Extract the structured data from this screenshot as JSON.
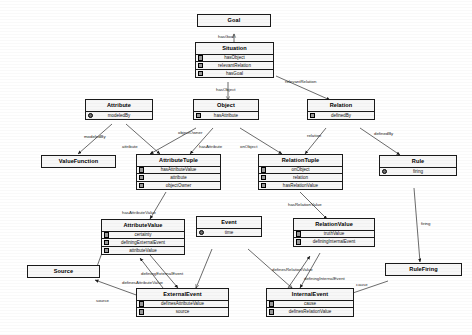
{
  "diagram": {
    "kind": "uml-class-diagram",
    "classes": [
      {
        "id": "goal",
        "name": "Goal",
        "attributes": []
      },
      {
        "id": "situation",
        "name": "Situation",
        "attributes": [
          "hasObject",
          "relevantRelation",
          "hasGoal"
        ]
      },
      {
        "id": "attribute",
        "name": "Attribute",
        "attributes": [
          "modeledBy"
        ]
      },
      {
        "id": "object",
        "name": "Object",
        "attributes": [
          "hasAttribute"
        ]
      },
      {
        "id": "relation",
        "name": "Relation",
        "attributes": [
          "definedBy"
        ]
      },
      {
        "id": "valuefunction",
        "name": "ValueFunction",
        "attributes": []
      },
      {
        "id": "attributetuple",
        "name": "AttributeTuple",
        "attributes": [
          "hasAttributeValue",
          "attribute",
          "objectOwner"
        ]
      },
      {
        "id": "relationtuple",
        "name": "RelationTuple",
        "attributes": [
          "onObject",
          "relation",
          "hasRelationValue"
        ]
      },
      {
        "id": "rule",
        "name": "Rule",
        "attributes": [
          "firing"
        ]
      },
      {
        "id": "attributevalue",
        "name": "AttributeValue",
        "attributes": [
          "certainty",
          "definingExternalEvent",
          "attributeValue"
        ]
      },
      {
        "id": "event",
        "name": "Event",
        "attributes": [
          "time"
        ]
      },
      {
        "id": "relationvalue",
        "name": "RelationValue",
        "attributes": [
          "truthValue",
          "definingInternalEvent"
        ]
      },
      {
        "id": "source",
        "name": "Source",
        "attributes": []
      },
      {
        "id": "externalevent",
        "name": "ExternalEvent",
        "attributes": [
          "definesAttributeValue",
          "source"
        ]
      },
      {
        "id": "internalevent",
        "name": "InternalEvent",
        "attributes": [
          "cause",
          "definesRelationValue"
        ]
      },
      {
        "id": "rulefiring",
        "name": "RuleFiring",
        "attributes": []
      }
    ],
    "edge_labels": [
      {
        "id": "e-hasgoal",
        "text": "hasGoal"
      },
      {
        "id": "e-relevantrelation",
        "text": "relevantRelation"
      },
      {
        "id": "e-hasobject",
        "text": "hasObject"
      },
      {
        "id": "e-modeledby",
        "text": "modeledBy"
      },
      {
        "id": "e-attribute",
        "text": "attribute"
      },
      {
        "id": "e-objectowner",
        "text": "objectOwner"
      },
      {
        "id": "e-hasattribute",
        "text": "hasAttribute"
      },
      {
        "id": "e-onobject",
        "text": "onObject"
      },
      {
        "id": "e-relation",
        "text": "relation"
      },
      {
        "id": "e-definedby",
        "text": "definedBy"
      },
      {
        "id": "e-hasattributevalue",
        "text": "hasAttributeValue"
      },
      {
        "id": "e-hasrelationvalue",
        "text": "hasRelationValue"
      },
      {
        "id": "e-firing",
        "text": "firing"
      },
      {
        "id": "e-definingexternalevent",
        "text": "definingExternalEvent"
      },
      {
        "id": "e-definesattributevalue",
        "text": "definesAttributeValue"
      },
      {
        "id": "e-time",
        "text": "time"
      },
      {
        "id": "e-definesrelationvalue",
        "text": "definesRelationValue"
      },
      {
        "id": "e-defininginternalevent",
        "text": "definingInternalEvent"
      },
      {
        "id": "e-cause",
        "text": "cause"
      },
      {
        "id": "e-source",
        "text": "source"
      }
    ],
    "colors": {
      "stroke": "#1a1a1a",
      "box_fill": "#f7f7f7",
      "text": "#000000",
      "canvas": "#ffffff"
    }
  }
}
